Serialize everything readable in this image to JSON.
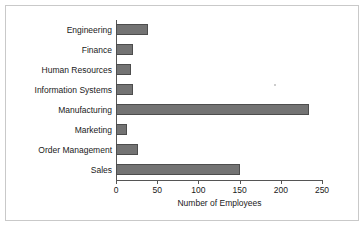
{
  "chart_data": {
    "type": "bar",
    "orientation": "horizontal",
    "title": "",
    "xlabel": "Number of Employees",
    "ylabel": "",
    "categories": [
      "Engineering",
      "Finance",
      "Human Resources",
      "Information Systems",
      "Manufacturing",
      "Marketing",
      "Order Management",
      "Sales"
    ],
    "values": [
      39,
      21,
      18,
      21,
      234,
      13,
      27,
      151
    ],
    "xlim": [
      0,
      250
    ],
    "xticks": [
      0,
      50,
      100,
      150,
      200,
      250
    ],
    "xtick_labels": [
      "0",
      "50",
      "100",
      "150",
      "200",
      "250"
    ],
    "grid": false,
    "legend": false,
    "bar_color": "#737373",
    "bar_edge_color": "#4d4d4d",
    "axis_color": "#555555",
    "frame_color": "#c9c9c9",
    "background": "#ffffff"
  }
}
